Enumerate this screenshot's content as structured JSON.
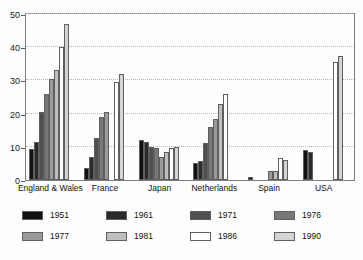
{
  "chart_data": {
    "type": "bar",
    "title": "",
    "subtitle": "",
    "xlabel": "",
    "ylabel": "",
    "ylim": [
      0,
      50
    ],
    "yticks": [
      "0",
      "10",
      "20",
      "30",
      "40",
      "50"
    ],
    "ytick_values": [
      0,
      10,
      20,
      30,
      40,
      50
    ],
    "grid": true,
    "legend_position": "below",
    "categories": [
      "England & Wales",
      "France",
      "Japan",
      "Netherlands",
      "Spain",
      "USA"
    ],
    "series": [
      {
        "name": "1951",
        "color": "#121212",
        "values": [
          9.3,
          3.5,
          12.0,
          5.0,
          1.0,
          9.0
        ]
      },
      {
        "name": "1961",
        "color": "#2b2b2b",
        "values": [
          11.5,
          7.0,
          11.3,
          5.7,
          null,
          8.5
        ]
      },
      {
        "name": "1971",
        "color": "#4f4f4f",
        "values": [
          20.5,
          12.8,
          10.0,
          11.2,
          null,
          null
        ]
      },
      {
        "name": "1976",
        "color": "#787878",
        "values": [
          26.0,
          19.0,
          9.5,
          16.0,
          null,
          null
        ]
      },
      {
        "name": "1977",
        "color": "#9a9a9a",
        "values": [
          30.3,
          20.6,
          7.0,
          18.3,
          2.6,
          null
        ]
      },
      {
        "name": "1981",
        "color": "#bfbfbf",
        "values": [
          33.0,
          null,
          8.5,
          23.0,
          2.6,
          null
        ]
      },
      {
        "name": "1986",
        "color": "#ffffff",
        "values": [
          40.0,
          29.5,
          9.5,
          26.0,
          6.5,
          35.5
        ]
      },
      {
        "name": "1990",
        "color": "#d4d4d4",
        "values": [
          47.0,
          32.0,
          10.0,
          null,
          6.0,
          37.5
        ]
      }
    ]
  },
  "legend": {
    "items": [
      {
        "label": "1951"
      },
      {
        "label": "1961"
      },
      {
        "label": "1971"
      },
      {
        "label": "1976"
      },
      {
        "label": "1977"
      },
      {
        "label": "1981"
      },
      {
        "label": "1986"
      },
      {
        "label": "1990"
      }
    ]
  },
  "colors": {
    "frame": "#7d7d7d",
    "grid": "#b9b9b9",
    "text": "#111111",
    "background": "#ffffff"
  }
}
